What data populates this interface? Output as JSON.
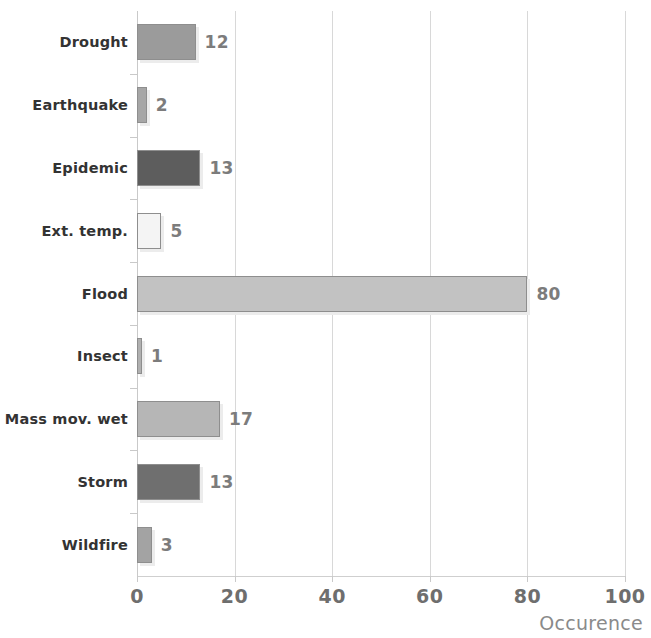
{
  "chart_data": {
    "type": "bar",
    "orientation": "horizontal",
    "title": "",
    "xlabel": "Occurence",
    "ylabel": "",
    "categories": [
      "Drought",
      "Earthquake",
      "Epidemic",
      "Ext. temp.",
      "Flood",
      "Insect",
      "Mass mov. wet",
      "Storm",
      "Wildfire"
    ],
    "values": [
      12,
      2,
      13,
      5,
      80,
      1,
      17,
      13,
      3
    ],
    "value_labels": [
      "12",
      "2",
      "13",
      "5",
      "80",
      "1",
      "17",
      "13",
      "3"
    ],
    "bar_colors": [
      "#9b9b9b",
      "#a6a6a6",
      "#5d5d5d",
      "#f4f4f4",
      "#c2c2c2",
      "#b0b0b0",
      "#b6b6b6",
      "#6f6f6f",
      "#a3a3a3"
    ],
    "xlim": [
      0,
      100
    ],
    "xticks": [
      0,
      20,
      40,
      60,
      80,
      100
    ],
    "xtick_labels": [
      "0",
      "20",
      "40",
      "60",
      "80",
      "100"
    ],
    "grid": true,
    "grid_axis": "x",
    "legend": false
  },
  "axis": {
    "x_title": "Occurence"
  }
}
